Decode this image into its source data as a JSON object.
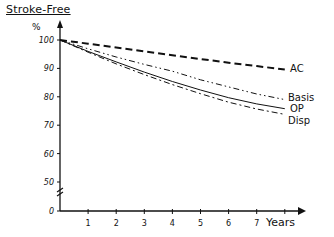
{
  "chart_data": {
    "type": "line",
    "title": "",
    "ylabel": "Stroke-Free",
    "yunit": "%",
    "xlabel": "Years",
    "x": [
      0,
      1,
      2,
      3,
      4,
      5,
      6,
      7,
      8
    ],
    "xticks": [
      "1",
      "2",
      "3",
      "4",
      "5",
      "6",
      "7"
    ],
    "yticks": [
      "0",
      "50",
      "60",
      "70",
      "80",
      "90",
      "100"
    ],
    "ylim": [
      0,
      100
    ],
    "axis_break": true,
    "grid": false,
    "legend_position": "inline-right",
    "series": [
      {
        "name": "AC",
        "style": "dashed",
        "values": [
          100,
          98.7,
          97.4,
          96.0,
          94.6,
          93.3,
          92.0,
          90.8,
          89.6
        ]
      },
      {
        "name": "Basis",
        "style": "dash-dot-dot",
        "values": [
          100,
          96.9,
          94.0,
          91.4,
          89.0,
          86.0,
          83.5,
          81.0,
          79.0
        ]
      },
      {
        "name": "OP",
        "style": "solid",
        "values": [
          100,
          96.0,
          92.3,
          88.7,
          85.4,
          82.4,
          79.7,
          77.5,
          75.8
        ]
      },
      {
        "name": "Disp",
        "style": "dash-dot",
        "values": [
          100,
          95.7,
          91.6,
          87.8,
          84.3,
          81.1,
          78.1,
          75.7,
          73.8
        ]
      }
    ]
  },
  "labels": {
    "ylabel": "Stroke-Free",
    "yunit": "%",
    "xlabel": "Years"
  }
}
